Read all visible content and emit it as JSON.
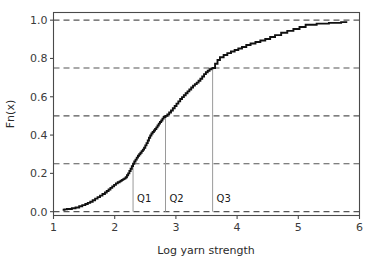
{
  "chart_data": {
    "type": "line",
    "subtype": "ecdf-step",
    "title": "",
    "xlabel": "Log yarn strength",
    "ylabel": "Fn(x)",
    "xlim": [
      1.0,
      6.0
    ],
    "ylim": [
      -0.02,
      1.04
    ],
    "xticks": [
      1,
      2,
      3,
      4,
      5,
      6
    ],
    "xtick_labels": [
      "1",
      "2",
      "3",
      "4",
      "5",
      "6"
    ],
    "yticks": [
      0.0,
      0.2,
      0.4,
      0.6,
      0.8,
      1.0
    ],
    "ytick_labels": [
      "0.0",
      "0.2",
      "0.4",
      "0.6",
      "0.8",
      "1.0"
    ],
    "grid": true,
    "grid_axis": "y",
    "gridlines_y": [
      0.0,
      0.25,
      0.5,
      0.75,
      1.0
    ],
    "grid_color": "#555555",
    "grid_style": "dashed",
    "legend": null,
    "curve_color": "#111111",
    "annotations": [
      {
        "name": "Q1",
        "label": "Q1",
        "x": 2.3,
        "y": 0.25
      },
      {
        "name": "Q2",
        "label": "Q2",
        "x": 2.83,
        "y": 0.5
      },
      {
        "name": "Q3",
        "label": "Q3",
        "x": 3.6,
        "y": 0.75
      }
    ],
    "series": [
      {
        "name": "ECDF",
        "x": [
          1.15,
          1.18,
          1.22,
          1.3,
          1.36,
          1.42,
          1.47,
          1.52,
          1.56,
          1.6,
          1.64,
          1.68,
          1.72,
          1.76,
          1.8,
          1.84,
          1.87,
          1.9,
          1.93,
          1.96,
          1.99,
          2.02,
          2.05,
          2.08,
          2.1,
          2.12,
          2.14,
          2.16,
          2.18,
          2.2,
          2.22,
          2.24,
          2.26,
          2.28,
          2.3,
          2.32,
          2.34,
          2.36,
          2.38,
          2.4,
          2.42,
          2.44,
          2.46,
          2.48,
          2.5,
          2.52,
          2.54,
          2.56,
          2.58,
          2.6,
          2.62,
          2.64,
          2.66,
          2.68,
          2.7,
          2.72,
          2.74,
          2.76,
          2.78,
          2.8,
          2.83,
          2.86,
          2.89,
          2.92,
          2.95,
          2.98,
          3.01,
          3.04,
          3.07,
          3.1,
          3.13,
          3.16,
          3.19,
          3.22,
          3.25,
          3.28,
          3.31,
          3.34,
          3.37,
          3.4,
          3.43,
          3.46,
          3.49,
          3.52,
          3.55,
          3.58,
          3.6,
          3.64,
          3.68,
          3.72,
          3.78,
          3.84,
          3.9,
          3.96,
          4.02,
          4.08,
          4.15,
          4.22,
          4.3,
          4.38,
          4.46,
          4.54,
          4.62,
          4.72,
          4.82,
          4.92,
          5.02,
          5.12,
          5.3,
          5.5,
          5.7,
          5.8
        ],
        "y": [
          0.01,
          0.012,
          0.014,
          0.018,
          0.022,
          0.028,
          0.034,
          0.04,
          0.046,
          0.052,
          0.06,
          0.068,
          0.076,
          0.084,
          0.092,
          0.1,
          0.108,
          0.116,
          0.124,
          0.132,
          0.14,
          0.148,
          0.154,
          0.158,
          0.162,
          0.166,
          0.17,
          0.174,
          0.18,
          0.19,
          0.2,
          0.212,
          0.224,
          0.238,
          0.25,
          0.262,
          0.272,
          0.282,
          0.292,
          0.3,
          0.308,
          0.316,
          0.324,
          0.334,
          0.346,
          0.358,
          0.372,
          0.386,
          0.398,
          0.408,
          0.416,
          0.424,
          0.432,
          0.44,
          0.45,
          0.46,
          0.468,
          0.476,
          0.486,
          0.494,
          0.5,
          0.508,
          0.518,
          0.528,
          0.54,
          0.552,
          0.564,
          0.576,
          0.588,
          0.598,
          0.608,
          0.618,
          0.628,
          0.638,
          0.648,
          0.658,
          0.666,
          0.674,
          0.684,
          0.694,
          0.706,
          0.718,
          0.728,
          0.736,
          0.744,
          0.748,
          0.75,
          0.772,
          0.792,
          0.806,
          0.818,
          0.828,
          0.836,
          0.844,
          0.852,
          0.86,
          0.87,
          0.878,
          0.886,
          0.894,
          0.902,
          0.912,
          0.922,
          0.934,
          0.944,
          0.954,
          0.964,
          0.976,
          0.982,
          0.986,
          0.99,
          0.99
        ]
      }
    ]
  },
  "axes": {
    "xlabel": "Log yarn strength",
    "ylabel": "Fn(x)"
  }
}
